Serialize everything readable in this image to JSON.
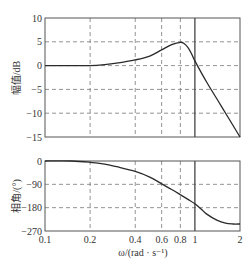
{
  "chart_data": [
    {
      "type": "line",
      "title": "",
      "xlabel": "",
      "ylabel": "幅值/dB",
      "xscale": "log",
      "xlim": [
        0.1,
        2
      ],
      "ylim": [
        -15,
        10
      ],
      "yticks": [
        10,
        5,
        0,
        -5,
        -10,
        -15
      ],
      "ytick_labels": [
        "10",
        "5",
        "0",
        "−5",
        "−10",
        "−15"
      ],
      "grid": true,
      "grid_x": [
        0.2,
        0.4,
        0.6,
        0.8
      ],
      "grid_y": [
        5,
        0,
        -5,
        -10
      ],
      "vline": {
        "x": 1,
        "style": "solid"
      },
      "series": [
        {
          "name": "magnitude",
          "x": [
            0.1,
            0.15,
            0.2,
            0.25,
            0.3,
            0.4,
            0.5,
            0.6,
            0.7,
            0.8,
            0.85,
            0.9,
            0.95,
            1.0,
            1.2,
            1.5,
            2.0
          ],
          "y": [
            0,
            0,
            0,
            0.2,
            0.5,
            1.2,
            2.0,
            3.3,
            4.4,
            4.9,
            4.6,
            3.8,
            2.5,
            1.0,
            -3.5,
            -8.5,
            -15
          ]
        }
      ]
    },
    {
      "type": "line",
      "title": "",
      "xlabel": "ω/(rad · s⁻¹)",
      "ylabel": "相角/(°)",
      "xscale": "log",
      "xlim": [
        0.1,
        2
      ],
      "ylim": [
        -270,
        0
      ],
      "xticks": [
        0.1,
        0.2,
        0.4,
        0.6,
        0.8,
        1,
        2
      ],
      "xtick_labels": [
        "0.1",
        "0.2",
        "0.4",
        "0.6",
        "0.8",
        "1",
        "2"
      ],
      "yticks": [
        0,
        -90,
        -180,
        -270
      ],
      "ytick_labels": [
        "0",
        "−90",
        "−180",
        "−270"
      ],
      "grid": true,
      "grid_x": [
        0.2,
        0.4,
        0.6,
        0.8
      ],
      "grid_y": [
        -90,
        -180
      ],
      "vline": {
        "x": 1,
        "style": "solid"
      },
      "series": [
        {
          "name": "phase",
          "x": [
            0.1,
            0.15,
            0.2,
            0.25,
            0.3,
            0.4,
            0.5,
            0.6,
            0.7,
            0.8,
            0.9,
            1.0,
            1.1,
            1.2,
            1.4,
            1.6,
            1.8,
            2.0
          ],
          "y": [
            0,
            0,
            -5,
            -12,
            -22,
            -40,
            -62,
            -88,
            -110,
            -130,
            -148,
            -165,
            -185,
            -205,
            -228,
            -240,
            -243,
            -243
          ]
        }
      ]
    }
  ],
  "labels": {
    "mag_ylabel": "幅值/dB",
    "phase_ylabel": "相角/(°)",
    "xlabel": "ω/(rad · s⁻¹)"
  },
  "colors": {
    "curve": "#2a2a2a",
    "axis": "#555555",
    "grid": "#777777",
    "vline": "#444444"
  }
}
